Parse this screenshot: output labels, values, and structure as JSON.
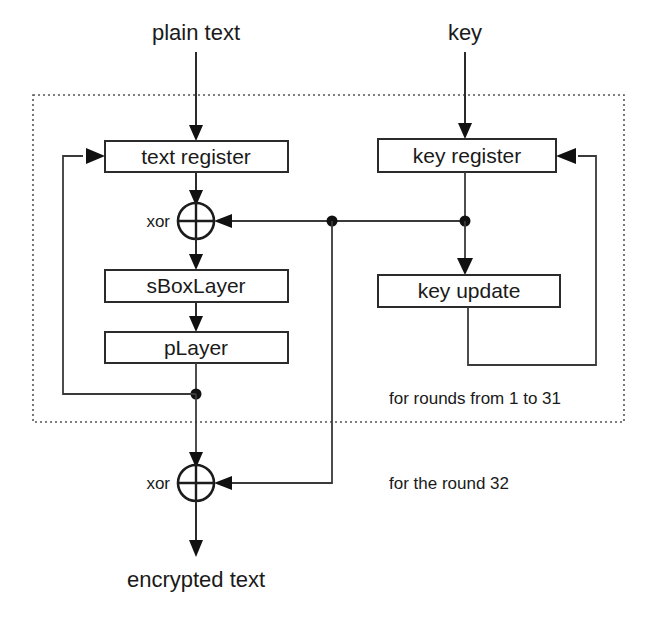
{
  "diagram": {
    "colors": {
      "stroke": "#2b2b2b",
      "background": "#ffffff",
      "frame": "#555555"
    },
    "io": {
      "plain_text": "plain text",
      "key": "key",
      "encrypted_text": "encrypted text"
    },
    "boxes": {
      "text_register": "text register",
      "key_register": "key register",
      "s_box_layer": "sBoxLayer",
      "p_layer": "pLayer",
      "key_update": "key update"
    },
    "operators": {
      "xor_round": "xor",
      "xor_final": "xor"
    },
    "notes": {
      "rounds_loop": "for rounds from 1 to  31",
      "final_round": "for the round 32"
    }
  }
}
